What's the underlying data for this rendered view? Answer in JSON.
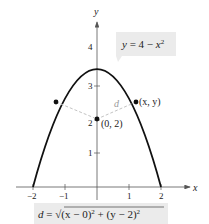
{
  "diagram": {
    "type": "function-graph",
    "axes": {
      "x_label": "x",
      "y_label": "y",
      "x_ticks": [
        {
          "value": -2,
          "label": "−2"
        },
        {
          "value": -1,
          "label": "−1"
        },
        {
          "value": 1,
          "label": "1"
        },
        {
          "value": 2,
          "label": "2"
        }
      ],
      "y_ticks": [
        {
          "value": 1,
          "label": "1"
        },
        {
          "value": 2,
          "label": "2"
        },
        {
          "value": 3,
          "label": "3"
        },
        {
          "value": 4,
          "label": "4"
        }
      ]
    },
    "curve": {
      "equation_label": {
        "lhs": "y",
        "eq": " = 4 − ",
        "var": "x",
        "exp": "2"
      },
      "x_range": [
        -2,
        2
      ],
      "color": "#111111"
    },
    "points": [
      {
        "name": "center",
        "label": "(0, 2)",
        "x": 0,
        "y": 2
      },
      {
        "name": "right",
        "label": "(x, y)",
        "x": 1.22,
        "y": 2.5
      },
      {
        "name": "left",
        "label": "",
        "x": -1.22,
        "y": 2.5
      }
    ],
    "distance_label": "d",
    "distance_formula": {
      "d": "d",
      "eq": " = ",
      "sqrt": "√",
      "part1": "(x − 0)",
      "exp1": "2",
      "plus": " + ",
      "part2": "(y − 2)",
      "exp2": "2"
    },
    "colors": {
      "label_bg": "#ebebeb",
      "dash": "#c4c4c4",
      "axis": "#555555"
    }
  }
}
